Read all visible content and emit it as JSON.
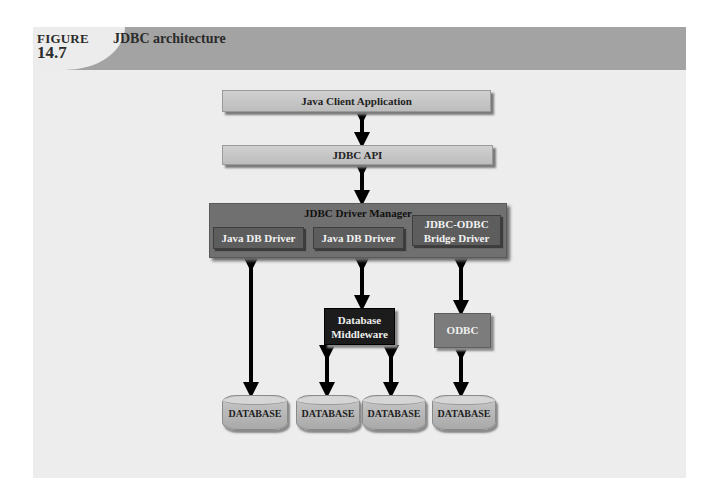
{
  "figure": {
    "label": "FIGURE",
    "number": "14.7",
    "title": "JDBC architecture"
  },
  "diagram": {
    "java_client": "Java Client Application",
    "jdbc_api": "JDBC API",
    "driver_manager": {
      "label": "JDBC Driver Manager",
      "drivers": [
        {
          "label": "Java DB Driver"
        },
        {
          "label": "Java DB Driver"
        },
        {
          "label_line1": "JDBC-ODBC",
          "label_line2": "Bridge Driver"
        }
      ]
    },
    "middleware": {
      "line1": "Database",
      "line2": "Middleware"
    },
    "odbc": "ODBC",
    "databases": [
      "DATABASE",
      "DATABASE",
      "DATABASE",
      "DATABASE"
    ]
  },
  "colors": {
    "header_band": "#a3a3a3",
    "panel": "#ededed",
    "driver_manager": "#707070",
    "driver": "#5d5d5d",
    "middleware": "#1c1c1c",
    "odbc": "#7c7c7c",
    "arrow": "#000000"
  }
}
